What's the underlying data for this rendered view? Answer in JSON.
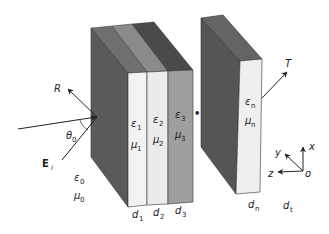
{
  "diagram": {
    "colors": {
      "background": "#ffffff",
      "side_face": "#5a5a5a",
      "top_face_1": "#6f6f6f",
      "top_face_2": "#8a8a8a",
      "top_face_3": "#4a4a4a",
      "front_layer_1": "#f2f2f2",
      "front_layer_2": "#ebebeb",
      "front_layer_3": "#9e9e9e",
      "slab_n_side": "#555555",
      "slab_n_top": "#646464",
      "slab_n_front": "#efefef",
      "line": "#222222"
    },
    "waves": {
      "reflected": {
        "symbol": "R"
      },
      "transmitted": {
        "symbol": "T"
      },
      "incident_field": {
        "symbol": "E",
        "subscript": "i"
      },
      "angle": {
        "symbol": "θ",
        "subscript": "0"
      }
    },
    "incident_medium": {
      "permittivity": {
        "symbol": "ε",
        "subscript": "0"
      },
      "permeability": {
        "symbol": "μ",
        "subscript": "0"
      }
    },
    "layers": [
      {
        "eps": "ε",
        "eps_sub": "1",
        "mu": "μ",
        "mu_sub": "1",
        "thickness": "d",
        "thickness_sub": "1"
      },
      {
        "eps": "ε",
        "eps_sub": "2",
        "mu": "μ",
        "mu_sub": "2",
        "thickness": "d",
        "thickness_sub": "2"
      },
      {
        "eps": "ε",
        "eps_sub": "3",
        "mu": "μ",
        "mu_sub": "3",
        "thickness": "d",
        "thickness_sub": "3"
      },
      {
        "eps": "ε",
        "eps_sub": "n",
        "mu": "μ",
        "mu_sub": "n",
        "thickness": "d",
        "thickness_sub": "n"
      }
    ],
    "ellipsis": "•••",
    "transmitted_region": {
      "thickness": "d",
      "thickness_sub": "t"
    },
    "axes": {
      "x": "x",
      "y": "y",
      "z": "z",
      "origin": "o"
    }
  }
}
